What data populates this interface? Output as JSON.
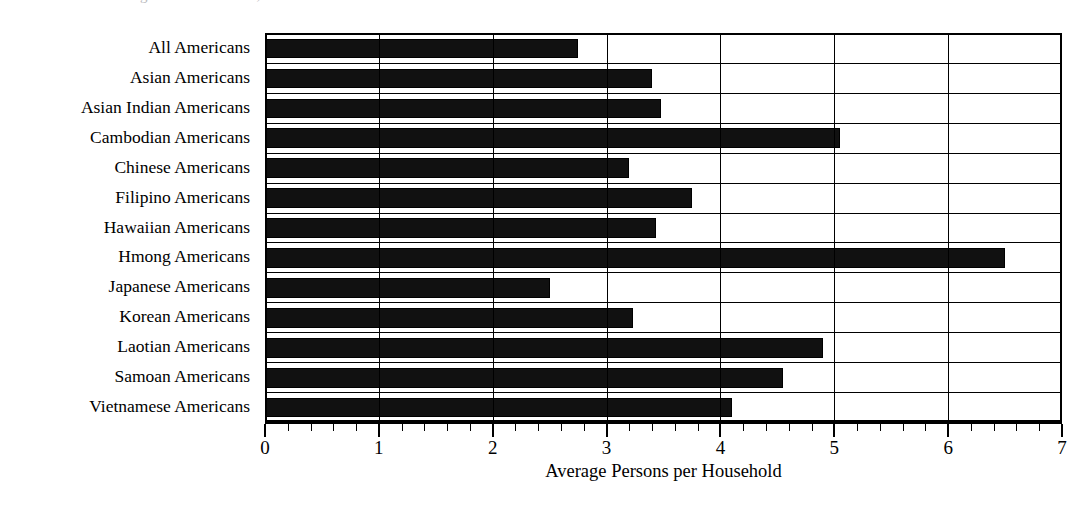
{
  "figure": {
    "title_partial": "ousehold size among Asian Americans, 2000",
    "background_color": "#ffffff",
    "bar_color": "#111111",
    "axis_color": "#000000"
  },
  "axis": {
    "x_title": "Average Persons per Household",
    "x_ticklabels": [
      "0",
      "1",
      "2",
      "3",
      "4",
      "5",
      "6",
      "7"
    ],
    "x_min": 0,
    "x_max": 7,
    "minor_ticks_per_unit": 5
  },
  "chart_data": {
    "type": "bar",
    "orientation": "horizontal",
    "title": "",
    "xlabel": "Average Persons per Household",
    "ylabel": "",
    "xlim": [
      0,
      7
    ],
    "grid": true,
    "legend": false,
    "categories": [
      "All Americans",
      "Asian Americans",
      "Asian Indian Americans",
      "Cambodian Americans",
      "Chinese Americans",
      "Filipino Americans",
      "Hawaiian Americans",
      "Hmong Americans",
      "Japanese Americans",
      "Korean Americans",
      "Laotian Americans",
      "Samoan Americans",
      "Vietnamese Americans"
    ],
    "values": [
      2.75,
      3.4,
      3.48,
      5.05,
      3.2,
      3.75,
      3.43,
      6.5,
      2.5,
      3.23,
      4.9,
      4.55,
      4.1
    ],
    "xticks": [
      0,
      1,
      2,
      3,
      4,
      5,
      6,
      7
    ]
  }
}
